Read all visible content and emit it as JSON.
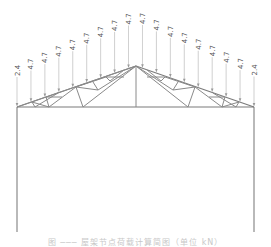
{
  "diagram": {
    "type": "gable roof truss with distributed point loads",
    "colors": {
      "members": "#8a8a8a",
      "load_lines": "#b0b0b0",
      "labels": "#555555"
    },
    "loads": {
      "end_value": "2.4",
      "interior_value": "4.7",
      "labels": [
        "2.4",
        "4.7",
        "4.7",
        "4.7",
        "4.7",
        "4.7",
        "4.7",
        "4.7",
        "4.7",
        "4.7",
        "4.7",
        "4.7",
        "4.7",
        "4.7",
        "4.7",
        "4.7",
        "4.7",
        "2.4"
      ]
    },
    "caption": "图 ─── 屋架节点荷载计算简图（单位 kN）"
  }
}
